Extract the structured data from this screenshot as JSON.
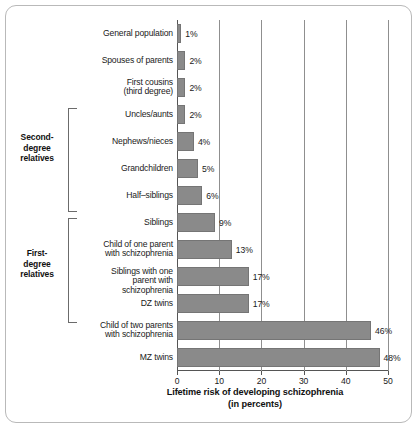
{
  "chart_data": {
    "type": "bar",
    "orientation": "horizontal",
    "title": "",
    "xlabel": "Lifetime risk of developing schizophrenia",
    "xlabel_sub": "(in percents)",
    "ylabel": "",
    "xlim": [
      0,
      50
    ],
    "xticks": [
      0,
      10,
      20,
      30,
      40,
      50
    ],
    "xtick_labels": [
      "0",
      "10",
      "20",
      "30",
      "40",
      "50"
    ],
    "grid": true,
    "grid_axis": "x",
    "legend": false,
    "bar_color": "#8a8a8a",
    "categories": [
      "General population",
      "Spouses of parents",
      "First cousins (third degree)",
      "Uncles/aunts",
      "Nephews/nieces",
      "Grandchildren",
      "Half-siblings",
      "Siblings",
      "Child of one parent with schizophrenia",
      "Siblings with one parent with schizophrenia",
      "DZ twins",
      "Child of two parents with schizophrenia",
      "MZ twins"
    ],
    "values": [
      1,
      2,
      2,
      2,
      4,
      5,
      6,
      9,
      13,
      17,
      17,
      46,
      48
    ],
    "value_labels": [
      "1%",
      "2%",
      "2%",
      "2%",
      "4%",
      "5%",
      "6%",
      "9%",
      "13%",
      "17%",
      "17%",
      "46%",
      "48%"
    ],
    "groups": [
      {
        "label": "Second-degree relatives",
        "label_lines": [
          "Second-",
          "degree",
          "relatives"
        ],
        "members": [
          "Uncles/aunts",
          "Nephews/nieces",
          "Grandchildren",
          "Half-siblings"
        ]
      },
      {
        "label": "First-degree relatives",
        "label_lines": [
          "First-",
          "degree",
          "relatives"
        ],
        "members": [
          "Siblings",
          "Child of one parent with schizophrenia",
          "Siblings with one parent with schizophrenia",
          "DZ twins"
        ]
      }
    ]
  },
  "rows": [
    {
      "label_lines": [
        "General population"
      ],
      "value": 1,
      "value_label": "1%"
    },
    {
      "label_lines": [
        "Spouses of parents"
      ],
      "value": 2,
      "value_label": "2%"
    },
    {
      "label_lines": [
        "First cousins",
        "(third degree)"
      ],
      "value": 2,
      "value_label": "2%"
    },
    {
      "label_lines": [
        "Uncles/aunts"
      ],
      "value": 2,
      "value_label": "2%"
    },
    {
      "label_lines": [
        "Nephews/nieces"
      ],
      "value": 4,
      "value_label": "4%"
    },
    {
      "label_lines": [
        "Grandchildren"
      ],
      "value": 5,
      "value_label": "5%"
    },
    {
      "label_lines": [
        "Half–siblings"
      ],
      "value": 6,
      "value_label": "6%"
    },
    {
      "label_lines": [
        "Siblings"
      ],
      "value": 9,
      "value_label": "9%"
    },
    {
      "label_lines": [
        "Child of one parent",
        "with schizophrenia"
      ],
      "value": 13,
      "value_label": "13%"
    },
    {
      "label_lines": [
        "Siblings with one",
        "parent with schizophrenia"
      ],
      "value": 17,
      "value_label": "17%"
    },
    {
      "label_lines": [
        "DZ twins"
      ],
      "value": 17,
      "value_label": "17%"
    },
    {
      "label_lines": [
        "Child of two parents",
        "with schizophrenia"
      ],
      "value": 46,
      "value_label": "46%"
    },
    {
      "label_lines": [
        "MZ twins"
      ],
      "value": 48,
      "value_label": "48%"
    }
  ],
  "axis": {
    "title_line1": "Lifetime risk of developing schizophrenia",
    "title_line2": "(in percents)",
    "ticks": [
      "0",
      "10",
      "20",
      "30",
      "40",
      "50"
    ]
  },
  "groups": {
    "second": {
      "line1": "Second-",
      "line2": "degree",
      "line3": "relatives"
    },
    "first": {
      "line1": "First-",
      "line2": "degree",
      "line3": "relatives"
    }
  }
}
